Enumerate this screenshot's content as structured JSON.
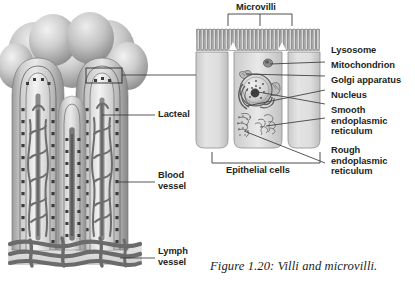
{
  "figure": {
    "caption": "Figure 1.20: Villi and microvilli.",
    "style": "grayscale biology textbook illustration"
  },
  "labels": {
    "microvilli": "Microvilli",
    "lysosome": "Lysosome",
    "mitochondrion": "Mitochondrion",
    "golgi_apparatus": "Golgi apparatus",
    "nucleus": "Nucleus",
    "smooth_er": "Smooth\nendoplasmic\nreticulum",
    "rough_er": "Rough\nendoplasmic\nreticulum",
    "epithelial_cells": "Epithelial cells",
    "lacteal": "Lacteal",
    "blood_vessel": "Blood\nvessel",
    "lymph_vessel": "Lymph\nvessel"
  },
  "colors": {
    "ink": "#231f20",
    "leader_line": "#3a3a3a",
    "tissue_light": "#dcdcdc",
    "tissue_mid": "#b4b4b4",
    "tissue_dark": "#8a8a8a",
    "vessel": "#6f6f6f",
    "background": "#ffffff"
  }
}
